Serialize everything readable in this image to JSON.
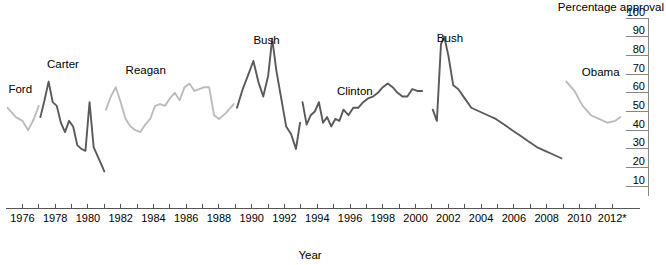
{
  "chart_data": {
    "type": "line",
    "title": "",
    "xlabel": "Year",
    "ylabel": "Percentage approval",
    "xlim": [
      1975.0,
      2012.6
    ],
    "ylim": [
      0,
      100
    ],
    "grid": true,
    "legend_position": "inline-labels",
    "y_ticks": [
      100,
      90,
      80,
      70,
      60,
      50,
      40,
      30,
      20,
      10
    ],
    "y_tick_labels": [
      "100",
      "90",
      "80",
      "70",
      "60",
      "50",
      "40",
      "30",
      "20",
      "10"
    ],
    "x_ticks": [
      1976,
      1977,
      1978,
      1979,
      1980,
      1981,
      1982,
      1983,
      1984,
      1985,
      1986,
      1987,
      1988,
      1989,
      1990,
      1991,
      1992,
      1993,
      1994,
      1995,
      1996,
      1997,
      1998,
      1999,
      2000,
      2001,
      2002,
      2003,
      2004,
      2005,
      2006,
      2007,
      2008,
      2009,
      2010,
      2011,
      2012
    ],
    "x_tick_labels": [
      "1976",
      "1978",
      "1980",
      "1982",
      "1984",
      "1986",
      "1988",
      "1990",
      "1992",
      "1994",
      "1996",
      "1998",
      "2000",
      "2002",
      "2004",
      "2006",
      "2008",
      "2010",
      "2012*"
    ],
    "x_tick_label_values": [
      1976,
      1978,
      1980,
      1982,
      1984,
      1986,
      1988,
      1990,
      1992,
      1994,
      1996,
      1998,
      2000,
      2002,
      2004,
      2006,
      2008,
      2010,
      2012
    ],
    "colors": {
      "dark": "#5a5a5a",
      "light": "#bcbcbc",
      "axis": "#555555",
      "text": "#000000",
      "background": "#ffffff"
    },
    "series": [
      {
        "name": "Ford",
        "label": "Ford",
        "shade": "light",
        "color": "#bcbcbc",
        "label_x": 1975.15,
        "label_y": 60,
        "x": [
          1975.1,
          1975.6,
          1976.0,
          1976.35,
          1976.7,
          1977.0
        ],
        "values": [
          52,
          47,
          45,
          40,
          46,
          53
        ]
      },
      {
        "name": "Carter",
        "label": "Carter",
        "shade": "dark",
        "color": "#5a5a5a",
        "label_x": 1977.5,
        "label_y": 73,
        "x": [
          1977.1,
          1977.35,
          1977.6,
          1977.85,
          1978.1,
          1978.35,
          1978.6,
          1978.85,
          1979.1,
          1979.35,
          1979.6,
          1979.85,
          1980.1,
          1980.35,
          1980.6,
          1980.85,
          1981.0
        ],
        "values": [
          47,
          56,
          66,
          55,
          53,
          44,
          39,
          45,
          42,
          32,
          30,
          29,
          55,
          31,
          26,
          21,
          18
        ]
      },
      {
        "name": "Reagan",
        "label": "Reagan",
        "shade": "light",
        "color": "#bcbcbc",
        "label_x": 1982.3,
        "label_y": 70,
        "x": [
          1981.1,
          1981.4,
          1981.7,
          1982.0,
          1982.3,
          1982.6,
          1982.9,
          1983.2,
          1983.5,
          1983.8,
          1984.1,
          1984.4,
          1984.7,
          1985.0,
          1985.3,
          1985.6,
          1985.9,
          1986.2,
          1986.5,
          1986.8,
          1987.1,
          1987.4,
          1987.7,
          1988.0,
          1988.4,
          1988.9
        ],
        "values": [
          51,
          58,
          63,
          55,
          46,
          42,
          40,
          39,
          43,
          46,
          53,
          54,
          53,
          57,
          60,
          56,
          63,
          65,
          61,
          62,
          63,
          63,
          48,
          46,
          49,
          54
        ]
      },
      {
        "name": "Bush",
        "label": "Bush",
        "shade": "dark",
        "color": "#5a5a5a",
        "label_x": 1990.1,
        "label_y": 86,
        "x": [
          1989.1,
          1989.45,
          1989.8,
          1990.1,
          1990.4,
          1990.7,
          1991.0,
          1991.25,
          1991.5,
          1991.8,
          1992.1,
          1992.4,
          1992.7,
          1992.95
        ],
        "values": [
          52,
          62,
          70,
          77,
          66,
          58,
          69,
          89,
          72,
          57,
          42,
          38,
          30,
          44
        ]
      },
      {
        "name": "Clinton",
        "label": "Clinton",
        "shade": "dark",
        "color": "#5a5a5a",
        "label_x": 1995.2,
        "label_y": 59,
        "x": [
          1993.1,
          1993.35,
          1993.6,
          1993.85,
          1994.1,
          1994.35,
          1994.6,
          1994.85,
          1995.1,
          1995.35,
          1995.6,
          1995.9,
          1996.2,
          1996.5,
          1996.8,
          1997.1,
          1997.4,
          1997.7,
          1998.0,
          1998.3,
          1998.6,
          1998.9,
          1999.2,
          1999.5,
          1999.8,
          2000.1,
          2000.4
        ],
        "values": [
          55,
          43,
          48,
          50,
          55,
          44,
          47,
          42,
          46,
          45,
          51,
          48,
          52,
          52,
          55,
          57,
          58,
          60,
          63,
          65,
          63,
          60,
          58,
          58,
          62,
          61,
          61
        ]
      },
      {
        "name": "Bush",
        "label": "Bush",
        "shade": "dark",
        "color": "#5a5a5a",
        "label_x": 2001.3,
        "label_y": 87,
        "x": [
          2001.05,
          2001.3,
          2001.55,
          2001.75,
          2002.0,
          2002.3,
          2002.6,
          2003.0,
          2003.4,
          2003.9,
          2004.4,
          2004.9,
          2005.4,
          2005.9,
          2006.4,
          2006.9,
          2007.4,
          2007.9,
          2008.4,
          2008.9
        ],
        "values": [
          51,
          45,
          86,
          90,
          80,
          64,
          62,
          57,
          52,
          50,
          48,
          46,
          43,
          40,
          37,
          34,
          31,
          29,
          27,
          25
        ]
      },
      {
        "name": "Obama",
        "label": "Obama",
        "shade": "light",
        "color": "#bcbcbc",
        "label_x": 2010.15,
        "label_y": 69,
        "x": [
          2009.2,
          2009.7,
          2010.2,
          2010.7,
          2011.2,
          2011.7,
          2012.2,
          2012.5
        ],
        "values": [
          66,
          61,
          53,
          48,
          46,
          44,
          45,
          47
        ]
      }
    ],
    "annotations": {
      "x_axis_footnote": "2012*"
    }
  }
}
